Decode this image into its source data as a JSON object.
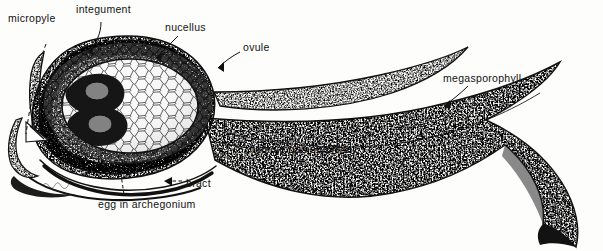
{
  "figure": {
    "style": "stippled pen-and-ink botanical illustration",
    "background_color": "#fdfdfc",
    "ink_color": "#111111",
    "signature": "artist initials"
  },
  "labels": [
    {
      "id": "micropyle",
      "text": "micropyle",
      "x": 8,
      "y": 12,
      "leader": "dashed"
    },
    {
      "id": "integument",
      "text": "integument",
      "x": 76,
      "y": 3,
      "leader": "solid"
    },
    {
      "id": "nucellus",
      "text": "nucellus",
      "x": 165,
      "y": 21,
      "leader": "solid"
    },
    {
      "id": "ovule",
      "text": "ovule",
      "x": 243,
      "y": 41,
      "leader": "solid"
    },
    {
      "id": "megasporophyll",
      "text": "megasporophyll",
      "x": 443,
      "y": 72,
      "leader": "solid"
    },
    {
      "id": "female-gametophyte",
      "text": "female gametophyte",
      "x": 252,
      "y": 143,
      "leader": "solid"
    },
    {
      "id": "bract",
      "text": "bract",
      "x": 186,
      "y": 177,
      "leader": "dashed"
    },
    {
      "id": "egg-in-archegonium",
      "text": "egg in archegonium",
      "x": 98,
      "y": 198,
      "leader": "dashed"
    }
  ],
  "structures": [
    {
      "id": "ovule-body",
      "name": "ovule",
      "texture": "stipple",
      "note": "large oval body at left"
    },
    {
      "id": "integument-layer",
      "name": "integument",
      "texture": "dense-stipple",
      "note": "outer coat of the ovule"
    },
    {
      "id": "nucellus-layer",
      "name": "nucellus",
      "texture": "stipple",
      "note": "tissue inside integument"
    },
    {
      "id": "gametophyte-body",
      "name": "female gametophyte",
      "texture": "cellular-mesh",
      "note": "central cellular region"
    },
    {
      "id": "archegonium-upper",
      "name": "egg in archegonium",
      "texture": "dark-solid",
      "note": "upper egg chamber"
    },
    {
      "id": "archegonium-lower",
      "name": "egg in archegonium",
      "texture": "dark-solid",
      "note": "lower egg chamber"
    },
    {
      "id": "micropyle-canal",
      "name": "micropyle",
      "texture": "open-channel",
      "note": "opening at left apex"
    },
    {
      "id": "bract-arc",
      "name": "bract",
      "texture": "dark-line",
      "note": "thin dark arc below ovule"
    },
    {
      "id": "megasporophyll-blade",
      "name": "megasporophyll",
      "texture": "stipple",
      "note": "long curving blade to the right"
    },
    {
      "id": "sporophyll-spike",
      "name": "megasporophyll tip",
      "texture": "stipple",
      "note": "slender upper spike"
    }
  ]
}
